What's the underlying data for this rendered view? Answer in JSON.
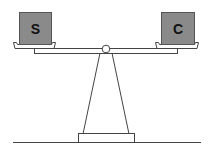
{
  "diagram": {
    "type": "balance-scale",
    "left_weight": {
      "label": "S",
      "color": "#8a8a8a"
    },
    "right_weight": {
      "label": "C",
      "color": "#8a8a8a"
    },
    "stroke_color": "#444444",
    "state": "balanced"
  }
}
